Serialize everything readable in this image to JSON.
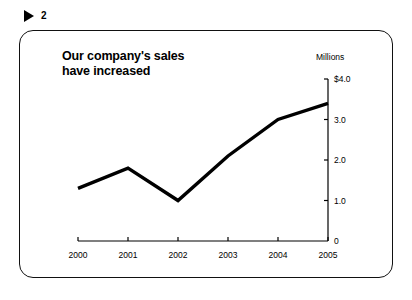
{
  "slide": {
    "marker_icon": "triangle-right-icon",
    "number": "2"
  },
  "chart_data": {
    "type": "line",
    "title": "Our company's sales\nhave increased",
    "unit_caption": "Millions",
    "categories": [
      "2000",
      "2001",
      "2002",
      "2003",
      "2004",
      "2005"
    ],
    "values": [
      1.3,
      1.8,
      1.0,
      2.1,
      3.0,
      3.4
    ],
    "series": [
      {
        "name": "Sales",
        "values": [
          1.3,
          1.8,
          1.0,
          2.1,
          3.0,
          3.4
        ]
      }
    ],
    "xlabel": "",
    "ylabel": "Millions",
    "ylim": [
      0,
      4.0
    ],
    "y_ticks": [
      0,
      1.0,
      2.0,
      3.0,
      4.0
    ],
    "y_tick_labels": [
      "0",
      "1.0",
      "2.0",
      "3.0",
      "$4.0"
    ],
    "x_tick_labels": [
      "2000",
      "2001",
      "2002",
      "2003",
      "2004",
      "2005"
    ],
    "grid": false,
    "legend": false,
    "y_axis_position": "right",
    "line_color": "#000000",
    "background_color": "#ffffff"
  }
}
